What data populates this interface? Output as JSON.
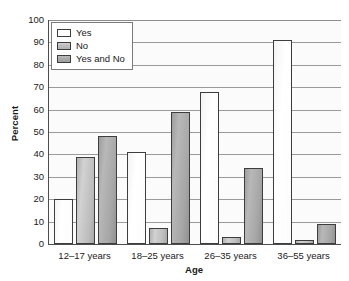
{
  "chart_data": {
    "type": "bar",
    "title": "",
    "subtitle": "",
    "xlabel": "Age",
    "ylabel": "Percent",
    "categories": [
      "12–17 years",
      "18–25 years",
      "26–35 years",
      "36–55 years"
    ],
    "series": [
      {
        "name": "Yes",
        "values": [
          20,
          41,
          68,
          91
        ],
        "color": "#ffffff"
      },
      {
        "name": "No",
        "values": [
          39,
          7,
          3,
          2
        ],
        "color": "#bdbdbd"
      },
      {
        "name": "Yes and No",
        "values": [
          48,
          59,
          34,
          9
        ],
        "color": "#a6a6a6"
      }
    ],
    "ylim": [
      0,
      100
    ],
    "ytick_labels": [
      "100",
      "90",
      "80",
      "70",
      "60",
      "50",
      "40",
      "30",
      "20",
      "10",
      "0"
    ],
    "ytick_values": [
      100,
      90,
      80,
      70,
      60,
      50,
      40,
      30,
      20,
      10,
      0
    ],
    "grid": true,
    "grid_axis": "y",
    "legend_position": "top-left",
    "orientation": "vertical",
    "grouping": "clustered"
  },
  "axes": {
    "y_title": "Percent",
    "x_title": "Age"
  },
  "legend": {
    "entries": [
      {
        "label": "Yes",
        "swatch": "legend-swatch-yes"
      },
      {
        "label": "No",
        "swatch": "legend-swatch-no"
      },
      {
        "label": "Yes and No",
        "swatch": "legend-swatch-yes-and-no"
      }
    ]
  },
  "colors": {
    "series_yes": "#ffffff",
    "series_no": "#bdbdbd",
    "series_yes_and_no": "#a6a6a6",
    "axis": "#4d4d4d",
    "gridline": "#9a9a9a",
    "text": "#1a1a1a",
    "plot_background": "#fbfbfb"
  }
}
